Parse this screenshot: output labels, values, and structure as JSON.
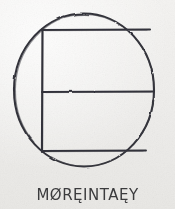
{
  "figure": {
    "kind": "hand-drawn-sketch",
    "medium": "pencil on textured paper",
    "background_color": "#f2f1ef",
    "ink_color": "#33333a",
    "shapes": [
      {
        "name": "circle",
        "type": "ellipse",
        "cx": 84,
        "cy": 90,
        "r": 70
      },
      {
        "name": "top-chord",
        "type": "line",
        "x1": 42,
        "y1": 30,
        "x2": 150,
        "y2": 30
      },
      {
        "name": "middle-chord",
        "type": "line",
        "x1": 42,
        "y1": 92,
        "x2": 154,
        "y2": 92
      },
      {
        "name": "bottom-chord",
        "type": "line",
        "x1": 42,
        "y1": 151,
        "x2": 146,
        "y2": 151
      },
      {
        "name": "left-vertical",
        "type": "line",
        "x1": 42,
        "y1": 30,
        "x2": 42,
        "y2": 151
      }
    ]
  },
  "caption": {
    "text": "MØRĘINTAĘY"
  },
  "colors": {
    "paper": "#f2f1ef",
    "ink": "#33333a",
    "caption_ink": "#3b3b3d"
  }
}
